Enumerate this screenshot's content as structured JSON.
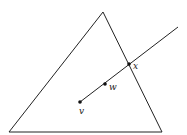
{
  "diagram": {
    "triangle": {
      "apex": [
        103,
        12
      ],
      "bottom_left": [
        9,
        132
      ],
      "bottom_right": [
        162,
        132
      ]
    },
    "ray": {
      "start": [
        80,
        102
      ],
      "end": [
        178,
        27
      ]
    },
    "points": [
      {
        "name": "v",
        "pos": [
          80,
          102
        ],
        "label": "v",
        "label_pos": [
          80,
          114
        ]
      },
      {
        "name": "w",
        "pos": [
          105,
          84
        ],
        "label": "w",
        "label_pos": [
          109,
          90
        ]
      },
      {
        "name": "x",
        "pos": [
          129,
          64
        ],
        "label": "x",
        "label_pos": [
          133,
          69
        ]
      }
    ],
    "colors": {
      "stroke": "#222222",
      "background": "#ffffff"
    }
  }
}
